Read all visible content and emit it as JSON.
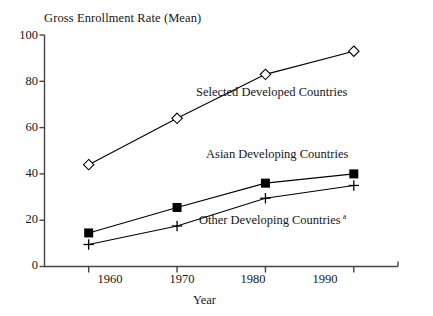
{
  "chart_data": {
    "type": "line",
    "title": "Gross Enrollment Rate (Mean)",
    "xlabel": "Year",
    "ylabel": "",
    "categories": [
      "1960",
      "1970",
      "1980",
      "1990"
    ],
    "x": [
      1960,
      1970,
      1980,
      1990
    ],
    "xlim": [
      1955,
      1995
    ],
    "ylim": [
      0,
      100
    ],
    "yticks": [
      "0",
      "20",
      "40",
      "60",
      "80",
      "100"
    ],
    "ytick_values": [
      0,
      20,
      40,
      60,
      80,
      100
    ],
    "grid": false,
    "legend_position": "inline-annotations",
    "series": [
      {
        "name": "Selected Developed Countries",
        "marker": "open-diamond",
        "color": "#000000",
        "values": [
          44,
          64,
          83,
          93
        ]
      },
      {
        "name": "Asian Developing Countries",
        "marker": "filled-square",
        "color": "#000000",
        "values": [
          14.5,
          25.5,
          36,
          40
        ]
      },
      {
        "name": "Other Developing Countries",
        "marker": "plus",
        "color": "#000000",
        "values": [
          9.5,
          17.5,
          29.5,
          35
        ],
        "footnote_marker": "a"
      }
    ],
    "annotations": [
      {
        "text": "Selected Developed Countries",
        "x": 1970.2,
        "y": 72
      },
      {
        "text": "Asian Developing Countries",
        "x": 1971.6,
        "y": 45
      },
      {
        "text": "Other Developing Countries",
        "x": 1970.6,
        "y": 22,
        "sup": "a"
      }
    ]
  },
  "axis": {
    "ytick_0": "0",
    "ytick_1": "20",
    "ytick_2": "40",
    "ytick_3": "60",
    "ytick_4": "80",
    "ytick_5": "100",
    "xtick_0": "1960",
    "xtick_1": "1970",
    "xtick_2": "1980",
    "xtick_3": "1990",
    "x_axis_title": "Year"
  },
  "labels": {
    "title": "Gross Enrollment Rate (Mean)",
    "series_developed": "Selected Developed Countries",
    "series_asian": "Asian Developing Countries",
    "series_other": "Other Developing Countries",
    "footnote_sup": "a"
  }
}
